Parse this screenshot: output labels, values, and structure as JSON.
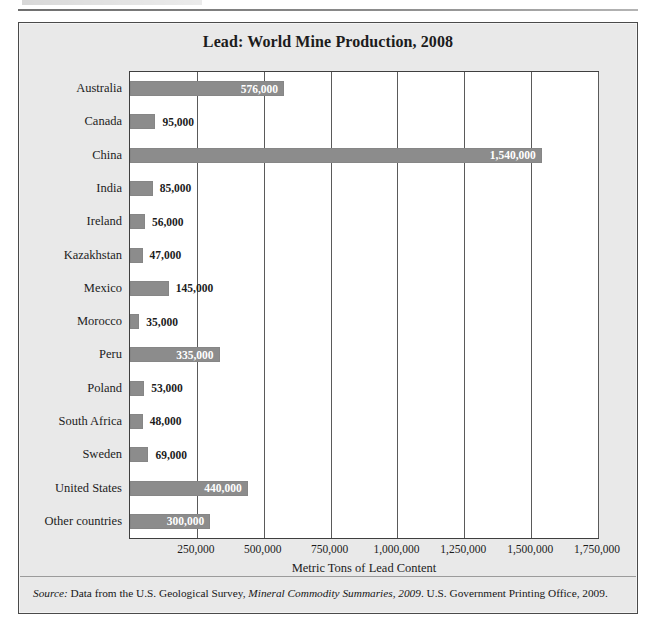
{
  "page": {
    "top_rule_present": true
  },
  "figure": {
    "title": "Lead: World Mine Production, 2008",
    "accent_bar_color": "#8c8c8c",
    "panel_color": "#e9e9e9",
    "plot_background": "#ffffff"
  },
  "source_note": {
    "label": "Source:",
    "text_1": " Data from the U.S. Geological Survey, ",
    "italic_title": "Mineral Commodity Summaries, 2009",
    "text_2": ". U.S. Government Printing Office, 2009."
  },
  "chart_data": {
    "type": "bar",
    "orientation": "horizontal",
    "title": "Lead: World Mine Production, 2008",
    "xlabel": "Metric Tons of Lead Content",
    "ylabel": "",
    "xlim": [
      0,
      1750000
    ],
    "grid": true,
    "legend": null,
    "categories": [
      "Australia",
      "Canada",
      "China",
      "India",
      "Ireland",
      "Kazakhstan",
      "Mexico",
      "Morocco",
      "Peru",
      "Poland",
      "South Africa",
      "Sweden",
      "United States",
      "Other countries"
    ],
    "values": [
      576000,
      95000,
      1540000,
      85000,
      56000,
      47000,
      145000,
      35000,
      335000,
      53000,
      48000,
      69000,
      440000,
      300000
    ],
    "value_labels": [
      "576,000",
      "95,000",
      "1,540,000",
      "85,000",
      "56,000",
      "47,000",
      "145,000",
      "35,000",
      "335,000",
      "53,000",
      "48,000",
      "69,000",
      "440,000",
      "300,000"
    ],
    "label_placement": [
      "inside",
      "outside",
      "inside",
      "outside",
      "outside",
      "outside",
      "outside",
      "outside",
      "inside",
      "outside",
      "outside",
      "outside",
      "inside",
      "inside"
    ],
    "xticks": [
      250000,
      500000,
      750000,
      1000000,
      1250000,
      1500000,
      1750000
    ],
    "xticklabels": [
      "250,000",
      "500,000",
      "750,000",
      "1,000,000",
      "1,250,000",
      "1,500,000",
      "1,750,000"
    ],
    "units": "metric tons of lead content",
    "year": 2008
  }
}
